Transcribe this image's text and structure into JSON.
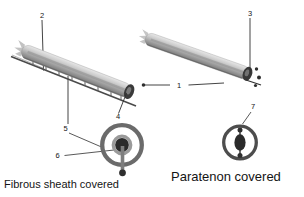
{
  "diagram": {
    "captions": {
      "left": "Fibrous sheath covered",
      "right": "Paratenon covered"
    },
    "callouts": [
      "1",
      "2",
      "3",
      "4",
      "5",
      "6",
      "7"
    ],
    "colors": {
      "background": "#ffffff",
      "leader_line": "#2f2f2f",
      "text": "#141414",
      "tendon_light": "#e8e8e8",
      "tendon_dark": "#747474",
      "end_cap": "#3a3a3a",
      "sheath_rail": "#4a4a4a",
      "cross_section_outer_ring": "#6b6b6b",
      "cross_section_inner_ring": "#9a9a9a",
      "tendon_core": "#2b2b2b",
      "vinculum_stem": "#7d7d7d"
    }
  }
}
